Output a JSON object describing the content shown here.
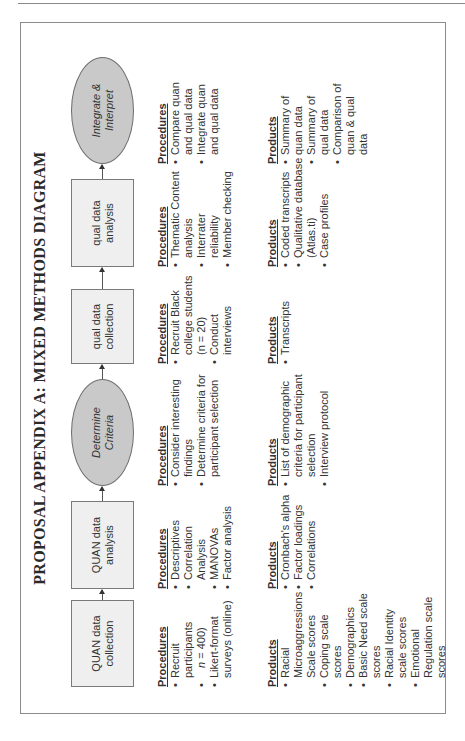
{
  "title": "PROPOSAL APPENDIX A: MIXED METHODS DIAGRAM",
  "nodes": [
    {
      "label": "QUAN data\ncollection",
      "shape": "box"
    },
    {
      "label": "QUAN data\nanalysis",
      "shape": "box"
    },
    {
      "label": "Determine\nCriteria",
      "shape": "ellipse"
    },
    {
      "label": "qual data\ncollection",
      "shape": "box"
    },
    {
      "label": "qual data\nanalysis",
      "shape": "box"
    },
    {
      "label": "Integrate &\nInterpret",
      "shape": "ellipse"
    }
  ],
  "procedures_header": "Procedures",
  "products_header": "Products",
  "stages": [
    {
      "procedures": [
        "Recruit participants",
        "(n = 400)",
        "Likert-format surveys (online)"
      ],
      "products": [
        "Racial Microaggressions Scale scores",
        "Coping scale scores",
        "Demographics",
        "Basic Need scale scores",
        "Racial Identity scale scores",
        "Emotional Regulation scale scores"
      ]
    },
    {
      "procedures": [
        "Descriptives",
        "Correlation Analysis",
        "MANOVAs",
        "Factor analysis"
      ],
      "products": [
        "Cronbach's alpha",
        "Factor loadings",
        "Correlations"
      ]
    },
    {
      "procedures": [
        "Consider interesting findings",
        "Determine criteria for participant selection"
      ],
      "products": [
        "List of demographic criteria for participant selection",
        "Interview protocol"
      ]
    },
    {
      "procedures": [
        "Recruit Black college students (n = 20)",
        "Conduct interviews"
      ],
      "products": [
        "Transcripts"
      ]
    },
    {
      "procedures": [
        "Thematic Content analysis",
        "Interrater reliability",
        "Member checking"
      ],
      "products": [
        "Coded transcripts",
        "Qualitative database (Atlas.ti)",
        "Case profiles"
      ]
    },
    {
      "procedures": [
        "Compare quan and qual data",
        "Integrate quan and qual data"
      ],
      "products": [
        "Summary of quan data",
        "Summary of qual data",
        "Comparison of quan & qual data"
      ]
    }
  ]
}
